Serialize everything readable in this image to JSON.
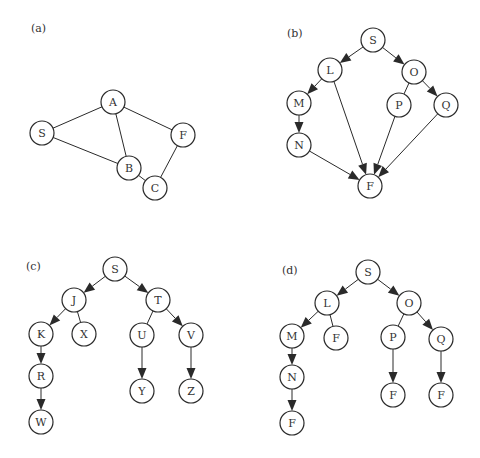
{
  "figure": {
    "node_radius": 12,
    "colors": {
      "stroke": "#2a2a2a",
      "fill": "#ffffff",
      "text": "#333333",
      "background": "#ffffff"
    },
    "panels": [
      {
        "id": "a",
        "label": "(a)",
        "label_pos": [
          31,
          32
        ],
        "type": "undirected-graph",
        "nodes": [
          {
            "id": "S",
            "label": "S",
            "x": 42,
            "y": 133
          },
          {
            "id": "A",
            "label": "A",
            "x": 113,
            "y": 102
          },
          {
            "id": "F",
            "label": "F",
            "x": 183,
            "y": 135
          },
          {
            "id": "B",
            "label": "B",
            "x": 129,
            "y": 168
          },
          {
            "id": "C",
            "label": "C",
            "x": 155,
            "y": 188
          }
        ],
        "edges": [
          {
            "from": "S",
            "to": "A",
            "directed": false
          },
          {
            "from": "S",
            "to": "B",
            "directed": false
          },
          {
            "from": "A",
            "to": "B",
            "directed": false
          },
          {
            "from": "A",
            "to": "F",
            "directed": false
          },
          {
            "from": "B",
            "to": "C",
            "directed": false
          },
          {
            "from": "C",
            "to": "F",
            "directed": false
          }
        ]
      },
      {
        "id": "b",
        "label": "(b)",
        "label_pos": [
          287,
          37
        ],
        "type": "directed-graph",
        "nodes": [
          {
            "id": "S",
            "label": "S",
            "x": 373,
            "y": 40
          },
          {
            "id": "L",
            "label": "L",
            "x": 330,
            "y": 70
          },
          {
            "id": "O",
            "label": "O",
            "x": 414,
            "y": 72
          },
          {
            "id": "M",
            "label": "M",
            "x": 299,
            "y": 103
          },
          {
            "id": "P",
            "label": "P",
            "x": 399,
            "y": 105
          },
          {
            "id": "Q",
            "label": "Q",
            "x": 446,
            "y": 105
          },
          {
            "id": "N",
            "label": "N",
            "x": 299,
            "y": 145
          },
          {
            "id": "F",
            "label": "F",
            "x": 370,
            "y": 186
          }
        ],
        "edges": [
          {
            "from": "S",
            "to": "L",
            "directed": true
          },
          {
            "from": "S",
            "to": "O",
            "directed": true
          },
          {
            "from": "L",
            "to": "M",
            "directed": true
          },
          {
            "from": "L",
            "to": "F",
            "directed": true
          },
          {
            "from": "O",
            "to": "P",
            "directed": false
          },
          {
            "from": "O",
            "to": "Q",
            "directed": true
          },
          {
            "from": "M",
            "to": "N",
            "directed": true
          },
          {
            "from": "N",
            "to": "F",
            "directed": true
          },
          {
            "from": "P",
            "to": "F",
            "directed": true
          },
          {
            "from": "Q",
            "to": "F",
            "directed": true
          }
        ]
      },
      {
        "id": "c",
        "label": "(c)",
        "label_pos": [
          26,
          270
        ],
        "type": "search-tree",
        "nodes": [
          {
            "id": "S",
            "label": "S",
            "x": 115,
            "y": 269
          },
          {
            "id": "J",
            "label": "J",
            "x": 74,
            "y": 300
          },
          {
            "id": "T",
            "label": "T",
            "x": 158,
            "y": 300
          },
          {
            "id": "K",
            "label": "K",
            "x": 41,
            "y": 334
          },
          {
            "id": "X",
            "label": "X",
            "x": 84,
            "y": 334
          },
          {
            "id": "U",
            "label": "U",
            "x": 142,
            "y": 335
          },
          {
            "id": "V",
            "label": "V",
            "x": 191,
            "y": 335
          },
          {
            "id": "R",
            "label": "R",
            "x": 41,
            "y": 376
          },
          {
            "id": "Y",
            "label": "Y",
            "x": 142,
            "y": 391
          },
          {
            "id": "Z",
            "label": "Z",
            "x": 191,
            "y": 391
          },
          {
            "id": "W",
            "label": "W",
            "x": 41,
            "y": 422
          }
        ],
        "edges": [
          {
            "from": "S",
            "to": "J",
            "directed": true
          },
          {
            "from": "S",
            "to": "T",
            "directed": true
          },
          {
            "from": "J",
            "to": "K",
            "directed": true
          },
          {
            "from": "J",
            "to": "X",
            "directed": false
          },
          {
            "from": "T",
            "to": "U",
            "directed": false
          },
          {
            "from": "T",
            "to": "V",
            "directed": true
          },
          {
            "from": "K",
            "to": "R",
            "directed": true
          },
          {
            "from": "R",
            "to": "W",
            "directed": true
          },
          {
            "from": "U",
            "to": "Y",
            "directed": true
          },
          {
            "from": "V",
            "to": "Z",
            "directed": true
          }
        ]
      },
      {
        "id": "d",
        "label": "(d)",
        "label_pos": [
          282,
          274
        ],
        "type": "search-tree",
        "nodes": [
          {
            "id": "S",
            "label": "S",
            "x": 368,
            "y": 272
          },
          {
            "id": "L",
            "label": "L",
            "x": 327,
            "y": 303
          },
          {
            "id": "O",
            "label": "O",
            "x": 409,
            "y": 303
          },
          {
            "id": "M",
            "label": "M",
            "x": 292,
            "y": 336
          },
          {
            "id": "F1",
            "label": "F",
            "x": 336,
            "y": 338
          },
          {
            "id": "P",
            "label": "P",
            "x": 393,
            "y": 337
          },
          {
            "id": "Q",
            "label": "Q",
            "x": 441,
            "y": 339
          },
          {
            "id": "N",
            "label": "N",
            "x": 292,
            "y": 377
          },
          {
            "id": "F2",
            "label": "F",
            "x": 393,
            "y": 395
          },
          {
            "id": "F3",
            "label": "F",
            "x": 441,
            "y": 395
          },
          {
            "id": "F4",
            "label": "F",
            "x": 292,
            "y": 423
          }
        ],
        "edges": [
          {
            "from": "S",
            "to": "L",
            "directed": true
          },
          {
            "from": "S",
            "to": "O",
            "directed": true
          },
          {
            "from": "L",
            "to": "M",
            "directed": true
          },
          {
            "from": "L",
            "to": "F1",
            "directed": false
          },
          {
            "from": "O",
            "to": "P",
            "directed": false
          },
          {
            "from": "O",
            "to": "Q",
            "directed": true
          },
          {
            "from": "M",
            "to": "N",
            "directed": true
          },
          {
            "from": "N",
            "to": "F4",
            "directed": true
          },
          {
            "from": "P",
            "to": "F2",
            "directed": true
          },
          {
            "from": "Q",
            "to": "F3",
            "directed": true
          }
        ]
      }
    ]
  }
}
